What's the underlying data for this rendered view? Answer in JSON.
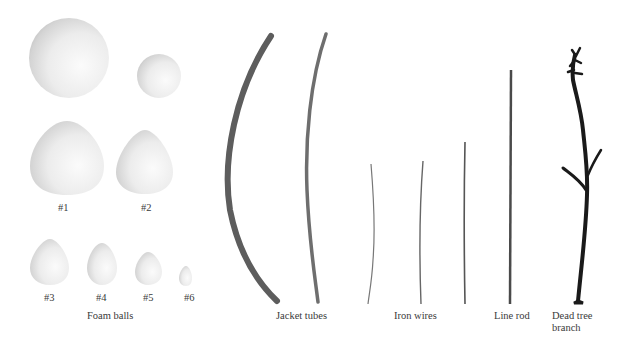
{
  "figure": {
    "groups": [
      {
        "name": "Foam balls",
        "items": [
          {
            "label": "#1"
          },
          {
            "label": "#2"
          },
          {
            "label": "#3"
          },
          {
            "label": "#4"
          },
          {
            "label": "#5"
          },
          {
            "label": "#6"
          }
        ]
      },
      {
        "name": "Jacket tubes"
      },
      {
        "name": "Iron wires"
      },
      {
        "name": "Line rod"
      },
      {
        "name": "Dead tree branch",
        "lines": [
          "Dead tree",
          "branch"
        ]
      }
    ]
  }
}
